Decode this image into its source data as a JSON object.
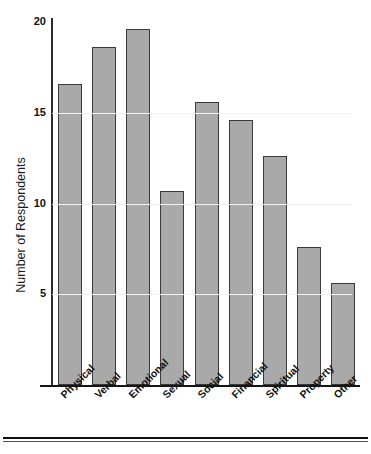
{
  "chart_data": {
    "type": "bar",
    "title": "",
    "xlabel": "",
    "ylabel": "Number of Respondents",
    "categories": [
      "Physical",
      "Verbal",
      "Emotional",
      "Sexual",
      "Social",
      "Financial",
      "Spiritual",
      "Property",
      "Other"
    ],
    "values": [
      16.6,
      18.6,
      19.6,
      10.7,
      15.6,
      14.6,
      12.6,
      7.6,
      5.6
    ],
    "ylim": [
      0,
      21
    ],
    "yticks": [
      5,
      10,
      15,
      20
    ],
    "ytick_labels": [
      "5",
      "10",
      "15",
      "20"
    ],
    "grid": true,
    "legend": false,
    "bar_color": "#a9a9a9",
    "bar_edge_color": "#3a3a3a",
    "axis_color": "#151515",
    "gridline_color": "#f2f2f2",
    "background": "#ffffff"
  },
  "axis": {
    "y_title": "Number of Respondents"
  }
}
